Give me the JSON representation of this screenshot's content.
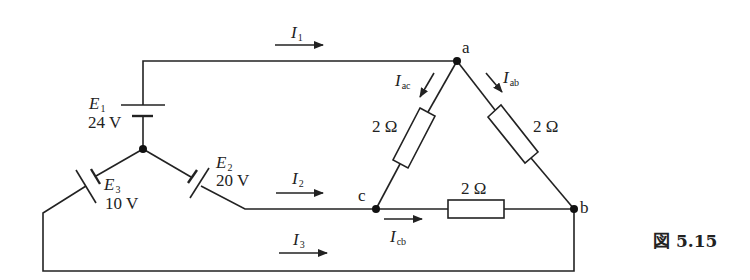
{
  "figure": {
    "caption": "図 5.15",
    "nodes": {
      "a": "a",
      "b": "b",
      "c": "c"
    },
    "sources": [
      {
        "id": "E1",
        "symbol": "E",
        "sub": "1",
        "value": "24 V"
      },
      {
        "id": "E2",
        "symbol": "E",
        "sub": "2",
        "value": "20 V"
      },
      {
        "id": "E3",
        "symbol": "E",
        "sub": "3",
        "value": "10 V"
      }
    ],
    "resistors": [
      {
        "branch": "ac",
        "value": "2 Ω"
      },
      {
        "branch": "ab",
        "value": "2 Ω"
      },
      {
        "branch": "cb",
        "value": "2 Ω"
      }
    ],
    "currents": [
      {
        "id": "I1",
        "symbol": "I",
        "sub": "1"
      },
      {
        "id": "I2",
        "symbol": "I",
        "sub": "2"
      },
      {
        "id": "I3",
        "symbol": "I",
        "sub": "3"
      },
      {
        "id": "Iac",
        "symbol": "I",
        "sub": "ac"
      },
      {
        "id": "Iab",
        "symbol": "I",
        "sub": "ab"
      },
      {
        "id": "Icb",
        "symbol": "I",
        "sub": "cb"
      }
    ]
  }
}
